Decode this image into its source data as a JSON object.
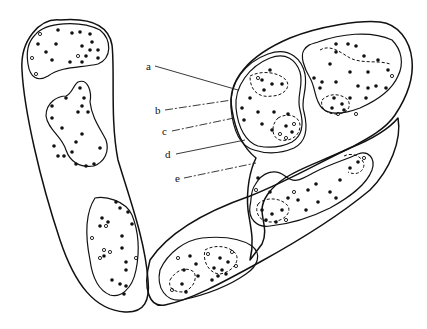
{
  "figure": {
    "labels": [
      {
        "id": "a",
        "text": "a",
        "x": 147,
        "y": 68,
        "tx": 238,
        "ty": 90
      },
      {
        "id": "b",
        "text": "b",
        "x": 155,
        "y": 112,
        "tx": 232,
        "ty": 100
      },
      {
        "id": "c",
        "text": "c",
        "x": 162,
        "y": 133,
        "tx": 234,
        "ty": 118
      },
      {
        "id": "d",
        "text": "d",
        "x": 165,
        "y": 156,
        "tx": 245,
        "ty": 140
      },
      {
        "id": "e",
        "text": "e",
        "x": 175,
        "y": 180,
        "tx": 256,
        "ty": 163
      }
    ],
    "colors": {
      "ink": "#111111",
      "paper": "#ffffff"
    }
  }
}
